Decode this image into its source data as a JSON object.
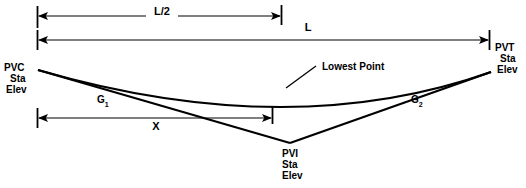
{
  "diagram": {
    "dimensions": {
      "half_length_label": "L/2",
      "full_length_label": "L",
      "offset_label": "X"
    },
    "points": {
      "pvc": {
        "code": "PVC",
        "station": "Sta",
        "elevation": "Elev"
      },
      "pvt": {
        "code": "PVT",
        "station": "Sta",
        "elevation": "Elev"
      },
      "pvi": {
        "code": "PVI",
        "station": "Sta",
        "elevation": "Elev"
      }
    },
    "grades": {
      "incoming": {
        "symbol": "G",
        "subscript": "1"
      },
      "outgoing": {
        "symbol": "G",
        "subscript": "2"
      }
    },
    "annotations": {
      "lowest_point": "Lowest Point"
    },
    "colors": {
      "stroke": "#000000",
      "background": "#ffffff"
    }
  }
}
